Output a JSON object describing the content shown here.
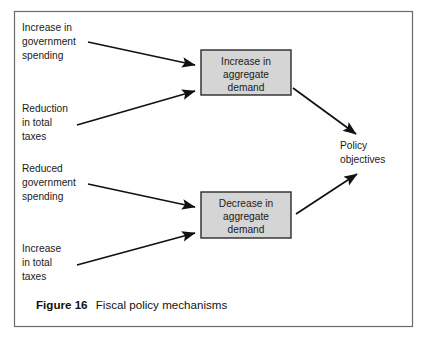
{
  "figure": {
    "caption_label": "Figure 16",
    "caption_title": "Fiscal policy mechanisms",
    "frame_color": "#6b6b6b",
    "background": "#ffffff"
  },
  "diagram": {
    "type": "flow-diagram",
    "box_fill": "#d5d5d5",
    "box_stroke": "#2a2a2a",
    "arrow_color": "#111111",
    "inputs": [
      {
        "id": "increase-government-spending",
        "lines": [
          "Increase in",
          "government",
          "spending"
        ],
        "line1": "Increase in",
        "line2": "government",
        "line3": "spending",
        "target": "increase-aggregate-demand"
      },
      {
        "id": "reduction-total-taxes",
        "lines": [
          "Reduction",
          "in total",
          "taxes"
        ],
        "line1": "Reduction",
        "line2": "in total",
        "line3": "taxes",
        "target": "increase-aggregate-demand"
      },
      {
        "id": "reduced-government-spending",
        "lines": [
          "Reduced",
          "government",
          "spending"
        ],
        "line1": "Reduced",
        "line2": "government",
        "line3": "spending",
        "target": "decrease-aggregate-demand"
      },
      {
        "id": "increase-total-taxes",
        "lines": [
          "Increase",
          "in total",
          "taxes"
        ],
        "line1": "Increase",
        "line2": "in total",
        "line3": "taxes",
        "target": "decrease-aggregate-demand"
      }
    ],
    "nodes": [
      {
        "id": "increase-aggregate-demand",
        "line1": "Increase in",
        "line2": "aggregate",
        "line3": "demand"
      },
      {
        "id": "decrease-aggregate-demand",
        "line1": "Decrease in",
        "line2": "aggregate",
        "line3": "demand"
      }
    ],
    "outcome": {
      "id": "policy-objectives",
      "line1": "Policy",
      "line2": "objectives"
    }
  }
}
